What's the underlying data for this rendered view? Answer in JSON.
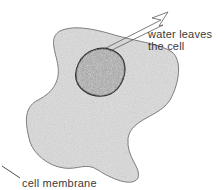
{
  "diagram": {
    "labels": {
      "water_line1": "water leaves",
      "water_line2": "the cell",
      "membrane": "cell membrane"
    },
    "colors": {
      "cytoplasm": "#dcdcdc",
      "outline": "#6a6a6a",
      "nucleus": "#8a8a8a",
      "nucleus_edge": "#2a2a2a",
      "text": "#3a3a3a"
    }
  }
}
